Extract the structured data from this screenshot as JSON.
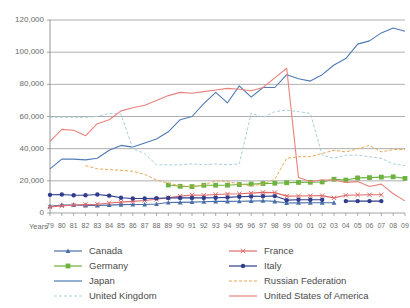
{
  "chart_data": {
    "type": "line",
    "title": "",
    "subtitle": "",
    "xlabel": "Years",
    "ylabel": "",
    "ylim": [
      0,
      120000
    ],
    "ytick_values": [
      0,
      20000,
      40000,
      60000,
      80000,
      100000,
      120000
    ],
    "ytick_labels": [
      "0",
      "20,000",
      "40,000",
      "60,000",
      "80,000",
      "100,000",
      "120,000"
    ],
    "grid": true,
    "legend_position": "bottom",
    "x": [
      1979,
      1980,
      1981,
      1982,
      1983,
      1984,
      1985,
      1986,
      1987,
      1988,
      1989,
      1990,
      1991,
      1992,
      1993,
      1994,
      1995,
      1996,
      1997,
      1998,
      1999,
      2000,
      2001,
      2002,
      2003,
      2004,
      2005,
      2006,
      2007,
      2008,
      2009
    ],
    "xtick_labels": [
      "79",
      "80",
      "81",
      "82",
      "83",
      "84",
      "85",
      "86",
      "87",
      "88",
      "89",
      "90",
      "91",
      "92",
      "93",
      "94",
      "95",
      "96",
      "97",
      "98",
      "99",
      "00",
      "01",
      "02",
      "03",
      "04",
      "05",
      "06",
      "07",
      "08",
      "09"
    ],
    "series": [
      {
        "name": "Canada",
        "color": "#4a6fa8",
        "style": "solid-marker",
        "marker": "triangle",
        "values": [
          4200,
          5000,
          5000,
          4700,
          4700,
          4900,
          5200,
          5300,
          5300,
          5600,
          6500,
          6600,
          6800,
          7000,
          7200,
          7200,
          7300,
          7400,
          7600,
          7200,
          6200,
          6300,
          6400,
          6400,
          6400,
          null,
          null,
          null,
          null,
          null,
          null
        ]
      },
      {
        "name": "Germany",
        "color": "#6cb33f",
        "style": "solid-marker",
        "marker": "square",
        "values": [
          null,
          null,
          null,
          null,
          null,
          null,
          null,
          null,
          null,
          null,
          17400,
          16600,
          16400,
          17200,
          17300,
          17300,
          17700,
          18000,
          18300,
          18500,
          18800,
          19000,
          19100,
          19300,
          21000,
          20500,
          21800,
          22000,
          22300,
          22500,
          21500
        ]
      },
      {
        "name": "Japan",
        "color": "#4f7bb5",
        "style": "solid",
        "marker": "none",
        "values": [
          27500,
          33500,
          33500,
          33000,
          34000,
          39000,
          42000,
          41000,
          43500,
          46000,
          50500,
          58000,
          60000,
          68000,
          75000,
          68500,
          79000,
          72000,
          78000,
          78000,
          86000,
          83500,
          82000,
          86000,
          92000,
          96000,
          105000,
          107000,
          112000,
          115000,
          113000
        ]
      },
      {
        "name": "United Kingdom",
        "color": "#a8cfd9",
        "style": "dashed",
        "marker": "none",
        "values": [
          59500,
          59500,
          59500,
          59500,
          60000,
          62000,
          61500,
          40000,
          37000,
          30000,
          30000,
          30000,
          30500,
          30000,
          30500,
          30000,
          30500,
          62000,
          59500,
          63000,
          64000,
          63000,
          62000,
          36000,
          34000,
          36000,
          36000,
          35000,
          34000,
          30500,
          29500
        ]
      },
      {
        "name": "France",
        "color": "#e06a6a",
        "style": "solid-marker",
        "marker": "cross",
        "values": [
          3800,
          4400,
          5000,
          5200,
          5500,
          6200,
          6800,
          7200,
          7800,
          8500,
          9500,
          10500,
          11200,
          11000,
          11500,
          11800,
          12000,
          12400,
          12800,
          12700,
          10500,
          10600,
          10700,
          10800,
          9400,
          11000,
          11200,
          11300,
          11300,
          null,
          null
        ]
      },
      {
        "name": "Italy",
        "color": "#2f3d8c",
        "style": "solid-marker",
        "marker": "circle",
        "values": [
          11300,
          11500,
          11000,
          11000,
          11500,
          10800,
          9500,
          9000,
          9000,
          9200,
          9300,
          9400,
          9400,
          9400,
          9500,
          9700,
          10100,
          10300,
          10400,
          10500,
          8000,
          8200,
          8200,
          8200,
          null,
          7400,
          7400,
          7400,
          7400,
          null,
          null
        ]
      },
      {
        "name": "Russian Federation",
        "color": "#e8a94f",
        "style": "dashed",
        "marker": "none",
        "values": [
          null,
          null,
          null,
          29500,
          27500,
          27000,
          26500,
          26000,
          24000,
          20500,
          18500,
          17000,
          16500,
          17500,
          20000,
          19500,
          18000,
          16800,
          18000,
          21000,
          34000,
          35000,
          35000,
          37000,
          39000,
          38000,
          40000,
          42000,
          38000,
          39500,
          39500
        ]
      },
      {
        "name": "United States of America",
        "color": "#e8827c",
        "style": "solid",
        "marker": "none",
        "values": [
          44500,
          52000,
          51500,
          48000,
          55500,
          58000,
          63500,
          65500,
          67000,
          70000,
          73000,
          75000,
          74500,
          75500,
          76500,
          77500,
          77000,
          76000,
          78000,
          84000,
          90000,
          22000,
          19500,
          20500,
          20500,
          19000,
          19500,
          16500,
          18000,
          12000,
          7500
        ]
      }
    ],
    "legend_left": [
      {
        "name": "Canada",
        "color": "#4a6fa8",
        "style": "solid-marker",
        "marker": "triangle"
      },
      {
        "name": "Germany",
        "color": "#6cb33f",
        "style": "solid-marker",
        "marker": "square"
      },
      {
        "name": "Japan",
        "color": "#4f7bb5",
        "style": "solid",
        "marker": "none"
      },
      {
        "name": "United Kingdom",
        "color": "#a8cfd9",
        "style": "dashed",
        "marker": "none"
      }
    ],
    "legend_right": [
      {
        "name": "France",
        "color": "#e06a6a",
        "style": "solid-marker",
        "marker": "cross"
      },
      {
        "name": "Italy",
        "color": "#2f3d8c",
        "style": "solid-marker",
        "marker": "circle"
      },
      {
        "name": "Russian Federation",
        "color": "#e8a94f",
        "style": "dashed",
        "marker": "none"
      },
      {
        "name": "United States of America",
        "color": "#e8827c",
        "style": "solid",
        "marker": "none"
      }
    ],
    "colors": {
      "gridline": "#9a9a9a",
      "axis": "#8a8a8a",
      "text": "#6b6b6b",
      "background": "#ffffff"
    }
  }
}
